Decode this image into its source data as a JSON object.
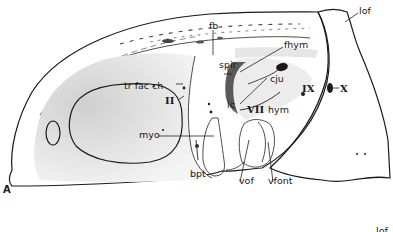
{
  "figure": {
    "panel_label": "A",
    "next_panel_partial_label": "lof",
    "labels": {
      "fb": "fb",
      "lof": "lof",
      "fhym": "fhym",
      "spir": "spir",
      "tr_fac_ch": "tr fac ch",
      "cju": "cju",
      "IX": "IX",
      "X": "X",
      "II": "II",
      "lc": "lc",
      "VII": "VII",
      "hym": "hym",
      "myo": "myo",
      "bpt": "bpt",
      "vof": "vof",
      "vfont": "vfont"
    },
    "colors": {
      "ink": "#1a1a1a",
      "stipple": "#9a9a9a",
      "background": "#ffffff"
    }
  }
}
